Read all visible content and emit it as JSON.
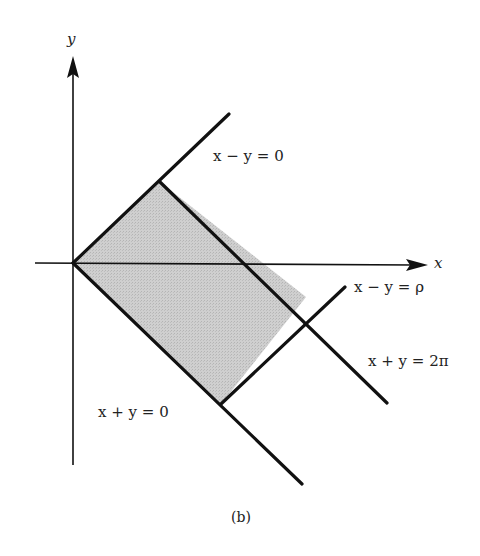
{
  "diagram": {
    "axes": {
      "x_label": "x",
      "y_label": "y"
    },
    "lines": [
      {
        "id": "x-minus-y-0",
        "label": "x − y = 0"
      },
      {
        "id": "x-minus-y-rho",
        "label": "x − y = ρ"
      },
      {
        "id": "x-plus-y-0",
        "label": "x + y = 0"
      },
      {
        "id": "x-plus-y-2pi",
        "label": "x + y = 2π"
      }
    ],
    "region": {
      "description": "shaded rectangle bounded by x−y=0, x−y=ρ, x+y=0, x+y=2π",
      "fill": "#c8c8c8"
    },
    "caption": "(b)"
  }
}
